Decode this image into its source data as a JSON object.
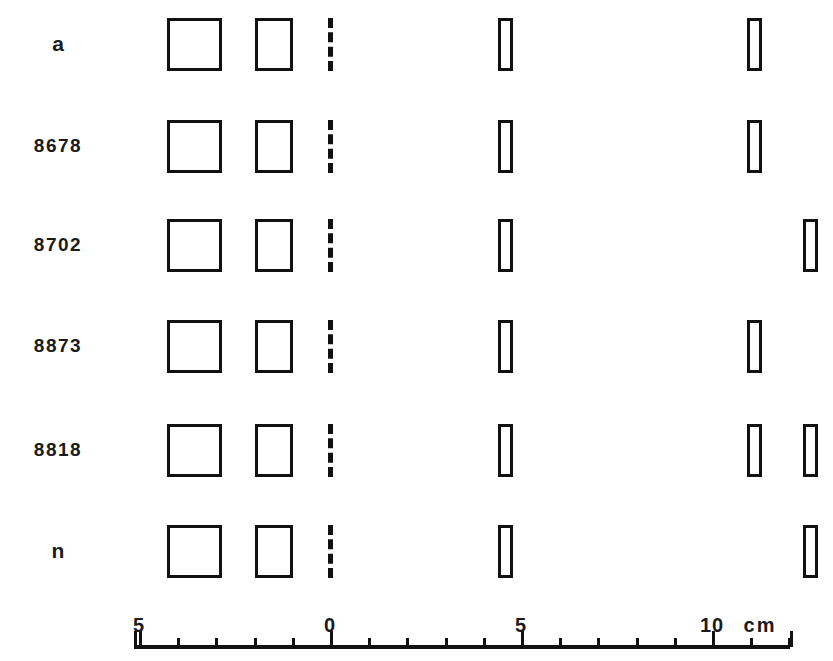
{
  "figure": {
    "width": 833,
    "height": 661,
    "background": "#ffffff",
    "ink_color": "#111111",
    "text_color": "#1a1a1a"
  },
  "rows": [
    {
      "label": "a",
      "label_kind": "glyph"
    },
    {
      "label": "8678",
      "label_kind": "number"
    },
    {
      "label": "8702",
      "label_kind": "number"
    },
    {
      "label": "8873",
      "label_kind": "number"
    },
    {
      "label": "8818",
      "label_kind": "number"
    },
    {
      "label": "n",
      "label_kind": "glyph"
    }
  ],
  "axis": {
    "caption_units": "cm",
    "tick_labels": [
      "5",
      "0",
      "5",
      "10"
    ],
    "major_positions_cm": [
      -5,
      0,
      5,
      10
    ],
    "minor_step_cm": 1,
    "range_cm": [
      -5.2,
      11.6
    ],
    "label_y": 614,
    "units_label": "cm",
    "line_y": 645
  },
  "chart_data": {
    "type": "scatter",
    "title": "",
    "xlabel": "cm",
    "ylabel": "",
    "xlim": [
      -5.2,
      11.6
    ],
    "grid": false,
    "legend": "none",
    "note": "Schematic plan view: each row is a specimen; shapes are rectangles drawn to scale along the cm axis. Dashed vertical line marks 0 cm datum.",
    "categories": [
      "a",
      "8678",
      "8702",
      "8873",
      "8818",
      "n"
    ],
    "series": [
      {
        "name": "a",
        "shapes": [
          {
            "kind": "square",
            "x_cm": -4.26,
            "w_cm": 1.45,
            "h_px": 53
          },
          {
            "kind": "rect",
            "x_cm": -1.97,
            "w_cm": 1.0,
            "h_px": 53
          },
          {
            "kind": "dashed-datum",
            "x_cm": 0.0,
            "h_px": 53
          },
          {
            "kind": "bar",
            "x_cm": 4.39,
            "w_cm": 0.39,
            "h_px": 53
          },
          {
            "kind": "bar",
            "x_cm": 10.92,
            "w_cm": 0.39,
            "h_px": 53
          }
        ]
      },
      {
        "name": "8678",
        "shapes": [
          {
            "kind": "square",
            "x_cm": -4.26,
            "w_cm": 1.45,
            "h_px": 53
          },
          {
            "kind": "rect",
            "x_cm": -1.97,
            "w_cm": 1.0,
            "h_px": 53
          },
          {
            "kind": "dashed-datum",
            "x_cm": 0.0,
            "h_px": 53
          },
          {
            "kind": "bar",
            "x_cm": 4.39,
            "w_cm": 0.39,
            "h_px": 53
          },
          {
            "kind": "bar",
            "x_cm": 10.92,
            "w_cm": 0.39,
            "h_px": 53
          }
        ]
      },
      {
        "name": "8702",
        "shapes": [
          {
            "kind": "square",
            "x_cm": -4.26,
            "w_cm": 1.45,
            "h_px": 53
          },
          {
            "kind": "rect",
            "x_cm": -1.97,
            "w_cm": 1.0,
            "h_px": 53
          },
          {
            "kind": "dashed-datum",
            "x_cm": 0.0,
            "h_px": 53
          },
          {
            "kind": "bar",
            "x_cm": 4.39,
            "w_cm": 0.39,
            "h_px": 53
          },
          {
            "kind": "bar",
            "x_cm": 12.37,
            "w_cm": 0.39,
            "h_px": 53
          }
        ]
      },
      {
        "name": "8873",
        "shapes": [
          {
            "kind": "square",
            "x_cm": -4.26,
            "w_cm": 1.45,
            "h_px": 53
          },
          {
            "kind": "rect",
            "x_cm": -1.97,
            "w_cm": 1.0,
            "h_px": 53
          },
          {
            "kind": "dashed-datum",
            "x_cm": 0.0,
            "h_px": 53
          },
          {
            "kind": "bar",
            "x_cm": 4.39,
            "w_cm": 0.39,
            "h_px": 53
          },
          {
            "kind": "bar",
            "x_cm": 10.92,
            "w_cm": 0.39,
            "h_px": 53
          }
        ]
      },
      {
        "name": "8818",
        "shapes": [
          {
            "kind": "square",
            "x_cm": -4.26,
            "w_cm": 1.45,
            "h_px": 53
          },
          {
            "kind": "rect",
            "x_cm": -1.97,
            "w_cm": 1.0,
            "h_px": 53
          },
          {
            "kind": "dashed-datum",
            "x_cm": 0.0,
            "h_px": 53
          },
          {
            "kind": "bar",
            "x_cm": 4.39,
            "w_cm": 0.39,
            "h_px": 53
          },
          {
            "kind": "bar",
            "x_cm": 10.92,
            "w_cm": 0.39,
            "h_px": 53
          },
          {
            "kind": "bar",
            "x_cm": 12.37,
            "w_cm": 0.39,
            "h_px": 53
          }
        ]
      },
      {
        "name": "n",
        "shapes": [
          {
            "kind": "square",
            "x_cm": -4.26,
            "w_cm": 1.45,
            "h_px": 53
          },
          {
            "kind": "rect",
            "x_cm": -1.97,
            "w_cm": 1.0,
            "h_px": 53
          },
          {
            "kind": "dashed-datum",
            "x_cm": 0.0,
            "h_px": 53
          },
          {
            "kind": "bar",
            "x_cm": 4.39,
            "w_cm": 0.39,
            "h_px": 53
          },
          {
            "kind": "bar",
            "x_cm": 12.37,
            "w_cm": 0.39,
            "h_px": 53
          }
        ]
      }
    ]
  },
  "geometry": {
    "x0_px": 330,
    "px_per_cm": 38.2,
    "label_x_px": 58,
    "row_center_y_px": [
      44,
      146,
      245,
      346,
      450,
      551
    ],
    "axis_line_y_px": 645,
    "axis_start_px": 134,
    "axis_end_px": 790,
    "tick_minor_h_px": 9,
    "tick_major_h_px": 16
  }
}
